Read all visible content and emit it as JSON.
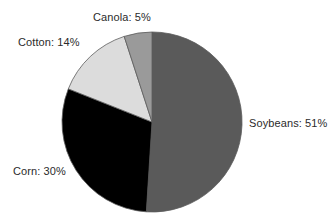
{
  "chart_data": {
    "type": "pie",
    "title": "",
    "subtitle": "",
    "xlabel": "",
    "ylabel": "",
    "legend_position": "none",
    "grid": false,
    "labels_format": "{name}: {value}%",
    "start_angle_deg": 0,
    "direction": "clockwise",
    "categories": [
      "Soybeans",
      "Corn",
      "Cotton",
      "Canola"
    ],
    "values": [
      51,
      30,
      14,
      5
    ],
    "units": "percent",
    "slices": [
      {
        "name": "Soybeans",
        "value": 51,
        "label": "Soybeans: 51%",
        "color": "#5a5a5a",
        "start_deg": 0,
        "end_deg": 183.6
      },
      {
        "name": "Corn",
        "value": 30,
        "label": "Corn: 30%",
        "color": "#000000",
        "start_deg": 183.6,
        "end_deg": 291.6
      },
      {
        "name": "Cotton",
        "value": 14,
        "label": "Cotton: 14%",
        "color": "#dcdcdc",
        "start_deg": 291.6,
        "end_deg": 342.0
      },
      {
        "name": "Canola",
        "value": 5,
        "label": "Canola: 5%",
        "color": "#9a9a9a",
        "start_deg": 342.0,
        "end_deg": 360.0
      }
    ],
    "geometry": {
      "center_x": 152,
      "center_y": 122,
      "radius": 90,
      "outline_color": "#5c5c5c"
    },
    "background_color": "#ffffff",
    "text_color": "#2b2b2b"
  }
}
